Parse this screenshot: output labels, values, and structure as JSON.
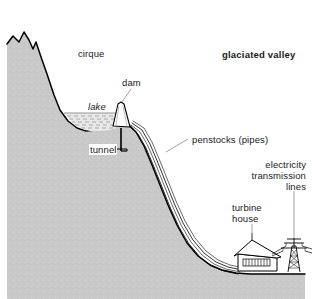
{
  "figure": {
    "title": "glaciated valley",
    "kind": "cross-section diagram of a glaciated valley hydro-electric scheme"
  },
  "labels": {
    "cirque": "cirque",
    "glaciated_valley": "glaciated valley",
    "dam": "dam",
    "lake": "lake",
    "tunnel": "tunnel",
    "penstocks": "penstocks (pipes)",
    "electricity_line1": "electricity",
    "electricity_line2": "transmission",
    "electricity_line3": "lines",
    "turbine_line1": "turbine",
    "turbine_line2": "house"
  },
  "colors": {
    "rock_fill": "#c9c9c9",
    "outline": "#000000",
    "leader": "#808080",
    "text": "#1a1a1a",
    "background": "#ffffff",
    "water_hatch": "#9a9a9a"
  },
  "features": [
    "mountain peak",
    "cirque hollow",
    "lake",
    "dam",
    "tunnel",
    "penstocks",
    "turbine house",
    "transmission pylon",
    "valley floor"
  ]
}
